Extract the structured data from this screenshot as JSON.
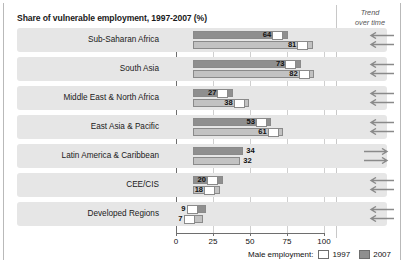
{
  "chart_data": {
    "type": "bar",
    "title": "Share of vulnerable employment, 1997-2007 (%)",
    "xlabel": "",
    "ylabel": "",
    "xlim": [
      0,
      100
    ],
    "xticks": [
      0,
      25,
      50,
      75,
      100
    ],
    "grid": true,
    "orientation": "horizontal",
    "legend_position": "bottom-right",
    "legend_title": "Male employment:",
    "categories": [
      "Sub-Saharan Africa",
      "South Asia",
      "Middle East & North Africa",
      "East Asia & Pacific",
      "Latin America & Caribbean",
      "CEE/CIS",
      "Developed Regions"
    ],
    "series": [
      {
        "name": "2007",
        "color": "#8f8f8f",
        "values": [
          64,
          73,
          27,
          53,
          34,
          20,
          9
        ]
      },
      {
        "name": "1997",
        "color": "#ffffff",
        "values": [
          81,
          82,
          38,
          61,
          32,
          18,
          7
        ]
      }
    ],
    "trend_over_time": [
      "left",
      "left",
      "left",
      "left",
      "right",
      "left",
      "left"
    ]
  },
  "header": {
    "title": "Share of vulnerable employment, 1997-2007 (%)",
    "trend_line1": "Trend",
    "trend_line2": "over time"
  },
  "axis": {
    "ticks": [
      {
        "label": "0",
        "value": 0
      },
      {
        "label": "25",
        "value": 25
      },
      {
        "label": "50",
        "value": 50
      },
      {
        "label": "75",
        "value": 75
      },
      {
        "label": "100",
        "value": 100
      }
    ]
  },
  "legend": {
    "title": "Male employment:",
    "items": [
      {
        "label": "1997",
        "swatch": "white"
      },
      {
        "label": "2007",
        "swatch": "gray"
      }
    ]
  },
  "rows": [
    {
      "category": "Sub-Saharan Africa",
      "v2007": 64,
      "v1997": 81,
      "label2007": "64",
      "label1997": "81",
      "trend": "left"
    },
    {
      "category": "South Asia",
      "v2007": 73,
      "v1997": 82,
      "label2007": "73",
      "label1997": "82",
      "trend": "left"
    },
    {
      "category": "Middle East & North Africa",
      "v2007": 27,
      "v1997": 38,
      "label2007": "27",
      "label1997": "38",
      "trend": "left"
    },
    {
      "category": "East Asia & Pacific",
      "v2007": 53,
      "v1997": 61,
      "label2007": "53",
      "label1997": "61",
      "trend": "left"
    },
    {
      "category": "Latin America & Caribbean",
      "v2007": 34,
      "v1997": 32,
      "label2007": "34",
      "label1997": "32",
      "trend": "right"
    },
    {
      "category": "CEE/CIS",
      "v2007": 20,
      "v1997": 18,
      "label2007": "20",
      "label1997": "18",
      "trend": "left"
    },
    {
      "category": "Developed Regions",
      "v2007": 9,
      "v1997": 7,
      "label2007": "9",
      "label1997": "7",
      "trend": "left"
    }
  ]
}
